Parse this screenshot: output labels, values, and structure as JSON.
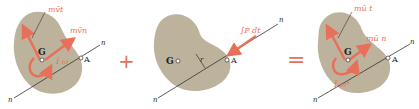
{
  "colors": {
    "body_fill": "#bdb39c",
    "vector_color": "#e8705a",
    "operator_color": "#e8705a",
    "line_color": "#333333"
  },
  "panels": [
    {
      "name": "initial-momentum",
      "labels": {
        "momentum_t": "mv̄t",
        "momentum_n": "mv̄n",
        "angular": "Ī ω",
        "center": "G",
        "point": "A",
        "axis_top": "n",
        "axis_bottom": "n"
      }
    },
    {
      "name": "impulse",
      "labels": {
        "impulse": "∫P dt",
        "center": "G",
        "point": "A",
        "radius": "r",
        "axis_top": "n",
        "axis_bottom": "n"
      }
    },
    {
      "name": "final-momentum",
      "labels": {
        "momentum_t": "mū t",
        "momentum_n": "mū n",
        "angular": "Ī ω*",
        "center": "G",
        "point": "A",
        "axis_top": "n",
        "axis_bottom": "n"
      }
    }
  ],
  "operators": {
    "plus": "+",
    "equals": "="
  }
}
